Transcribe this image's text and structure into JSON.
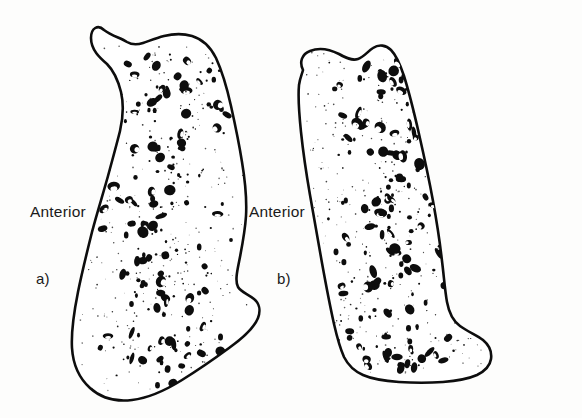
{
  "figure": {
    "background_color": "#fdfdfc",
    "ink_color": "#0d0d0d",
    "width": 582,
    "height": 418
  },
  "panels": [
    {
      "id": "a",
      "label": "a)",
      "orientation_label": "Anterior",
      "outline_path": "M104,30 C98,24 91,28 91,38 C91,50 100,58 107,64 C114,71 118,80 121,92 C124,105 123,118 120,131 C116,147 112,161 108,176 C103,194 97,213 92,232 C87,252 82,272 78,292 C74,312 71,331 72,348 C73,364 79,378 90,388 C101,398 116,402 132,400 C149,398 166,390 182,380 C198,370 214,359 229,348 C243,338 254,328 258,318 C261,310 259,303 254,299 C248,294 241,292 238,287 C235,281 237,272 239,262 C242,247 245,232 246,216 C247,198 245,180 242,162 C239,143 235,124 231,106 C227,88 222,71 216,58 C210,46 202,39 192,36 C182,33 172,34 164,36 C156,38 149,41 143,43 C137,45 132,45 127,42 C121,38 112,36 104,30 Z",
      "speckle_seed": 17,
      "speckle_count": 210
    },
    {
      "id": "b",
      "label": "b)",
      "orientation_label": "Anterior",
      "outline_path": "M303,70 C299,62 302,54 310,51 C320,47 331,50 339,54 C346,58 352,61 358,59 C364,57 368,51 373,48 C379,44 386,45 391,50 C396,55 400,64 404,76 C409,92 414,112 419,134 C424,156 429,179 433,201 C437,223 440,243 442,261 C444,277 445,291 447,302 C449,313 453,321 460,326 C468,332 477,335 483,340 C489,345 492,352 491,359 C490,366 485,371 477,375 C468,379 456,381 443,382 C429,383 414,383 399,382 C385,381 372,379 363,375 C354,371 348,365 344,357 C340,348 337,337 334,324 C330,306 326,285 322,263 C318,240 314,217 310,195 C306,172 303,151 301,132 C299,113 298,96 299,85 C300,78 302,74 303,70 Z",
      "speckle_seed": 43,
      "speckle_count": 235
    }
  ]
}
